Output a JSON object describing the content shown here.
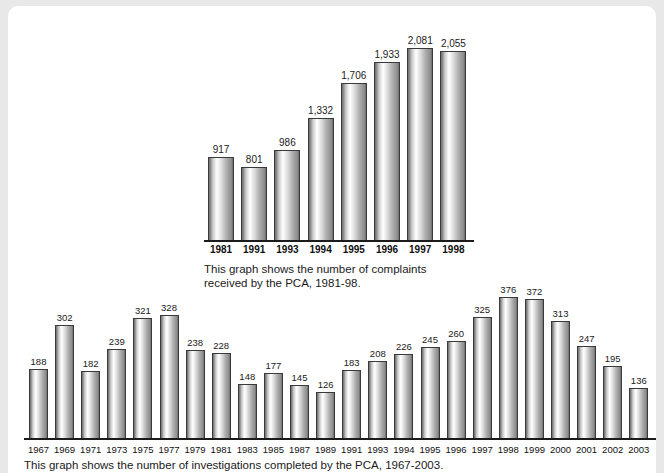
{
  "page": {
    "background_color": "#ffffff",
    "surround_color": "#e8e8e8"
  },
  "chart_data": [
    {
      "id": "complaints-chart",
      "type": "bar",
      "title": "",
      "caption": "This graph shows the number of complaints\nreceived by the PCA, 1981-98.",
      "xlabel": "",
      "ylabel": "",
      "ylim": [
        0,
        2200
      ],
      "grid": false,
      "legend": "none",
      "categories": [
        "1981",
        "1991",
        "1993",
        "1994",
        "1995",
        "1996",
        "1997",
        "1998"
      ],
      "values": [
        917,
        801,
        986,
        1332,
        1706,
        1933,
        2081,
        2055
      ],
      "value_labels": [
        "917",
        "801",
        "986",
        "1,332",
        "1,706",
        "1,933",
        "2,081",
        "2,055"
      ]
    },
    {
      "id": "investigations-chart",
      "type": "bar",
      "title": "",
      "caption": "This graph shows the number of investigations completed by the PCA, 1967-2003.",
      "xlabel": "",
      "ylabel": "",
      "ylim": [
        0,
        400
      ],
      "grid": false,
      "legend": "none",
      "categories": [
        "1967",
        "1969",
        "1971",
        "1973",
        "1975",
        "1977",
        "1979",
        "1981",
        "1983",
        "1985",
        "1987",
        "1989",
        "1991",
        "1993",
        "1994",
        "1995",
        "1996",
        "1997",
        "1998",
        "1999",
        "2000",
        "2001",
        "2002",
        "2003"
      ],
      "values": [
        188,
        302,
        182,
        239,
        321,
        328,
        238,
        228,
        148,
        177,
        145,
        126,
        183,
        208,
        226,
        245,
        260,
        325,
        376,
        372,
        313,
        247,
        195,
        136
      ],
      "value_labels": [
        "188",
        "302",
        "182",
        "239",
        "321",
        "328",
        "238",
        "228",
        "148",
        "177",
        "145",
        "126",
        "183",
        "208",
        "226",
        "245",
        "260",
        "325",
        "376",
        "372",
        "313",
        "247",
        "195",
        "136"
      ]
    }
  ]
}
